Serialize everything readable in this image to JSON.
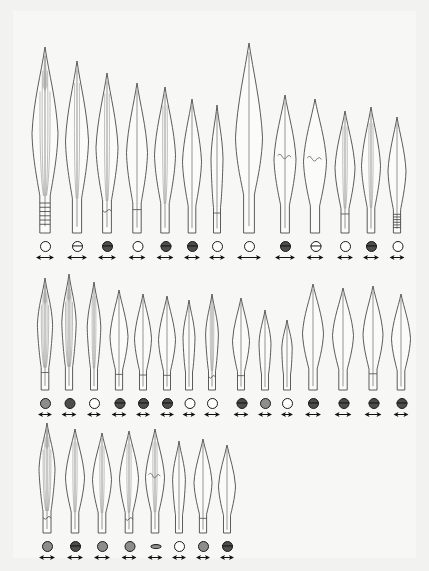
{
  "plate": {
    "title": "",
    "background_color": "#f2f2f0",
    "paper_color": "#f7f7f5",
    "ink_color": "#4a4a4a",
    "figure_type": "archaeological-typology-plate",
    "subject": "bronze spearheads",
    "total_items": 36,
    "row_counts": [
      13,
      15,
      8
    ]
  },
  "legend": {
    "section_symbol_note": "circle = blade cross-section",
    "scale_symbol_note": "double-headed arrow = scale bar"
  },
  "rows": [
    {
      "row_index": 0,
      "items": [
        {
          "num": "1",
          "x": 32,
          "h": 186,
          "w": 26,
          "blade": "leaf",
          "section": "open",
          "socket": "hatched",
          "arrow": 18,
          "ribs": 3,
          "shade": true,
          "break": false
        },
        {
          "num": "2",
          "x": 64,
          "h": 172,
          "w": 23,
          "blade": "leaf",
          "section": "line",
          "socket": "plain",
          "arrow": 20,
          "ribs": 2,
          "shade": false,
          "break": false
        },
        {
          "num": "3",
          "x": 94,
          "h": 160,
          "w": 22,
          "blade": "leaf",
          "section": "half",
          "socket": "notched",
          "arrow": 18,
          "ribs": 2,
          "shade": false,
          "break": false
        },
        {
          "num": "4",
          "x": 124,
          "h": 150,
          "w": 21,
          "blade": "leaf",
          "section": "open",
          "socket": "band",
          "arrow": 17,
          "ribs": 1,
          "shade": false,
          "break": false
        },
        {
          "num": "5",
          "x": 152,
          "h": 146,
          "w": 21,
          "blade": "leaf",
          "section": "half",
          "socket": "plain",
          "arrow": 17,
          "ribs": 2,
          "shade": false,
          "break": false
        },
        {
          "num": "6",
          "x": 179,
          "h": 134,
          "w": 19,
          "blade": "leaf",
          "section": "half",
          "socket": "plain",
          "arrow": 16,
          "ribs": 1,
          "shade": false,
          "break": false
        },
        {
          "num": "7",
          "x": 204,
          "h": 128,
          "w": 15,
          "blade": "slim",
          "section": "open",
          "socket": "band",
          "arrow": 16,
          "ribs": 1,
          "shade": false,
          "break": false
        },
        {
          "num": "8",
          "x": 236,
          "h": 190,
          "w": 27,
          "blade": "broad",
          "section": "open",
          "socket": "plain",
          "arrow": 24,
          "ribs": 1,
          "shade": false,
          "break": false
        },
        {
          "num": "9",
          "x": 272,
          "h": 138,
          "w": 22,
          "blade": "leaf",
          "section": "half",
          "socket": "plain",
          "arrow": 20,
          "ribs": 1,
          "shade": false,
          "break": true
        },
        {
          "num": "10",
          "x": 302,
          "h": 134,
          "w": 23,
          "blade": "leaf",
          "section": "line",
          "socket": "plain",
          "arrow": 17,
          "ribs": 0,
          "shade": false,
          "break": true
        },
        {
          "num": "11",
          "x": 332,
          "h": 122,
          "w": 20,
          "blade": "leaf",
          "section": "open",
          "socket": "band",
          "arrow": 16,
          "ribs": 2,
          "shade": false,
          "break": false
        },
        {
          "num": "12",
          "x": 358,
          "h": 126,
          "w": 19,
          "blade": "leaf",
          "section": "half",
          "socket": "plain",
          "arrow": 16,
          "ribs": 2,
          "shade": false,
          "break": false
        },
        {
          "num": "13",
          "x": 384,
          "h": 116,
          "w": 18,
          "blade": "leaf",
          "section": "open",
          "socket": "hatched",
          "arrow": 15,
          "ribs": 1,
          "shade": false,
          "break": false
        }
      ]
    },
    {
      "row_index": 1,
      "items": [
        {
          "num": "14",
          "x": 32,
          "h": 112,
          "w": 19,
          "blade": "slim",
          "section": "grey",
          "socket": "band",
          "arrow": 14,
          "ribs": 3,
          "shade": true,
          "break": false
        },
        {
          "num": "15",
          "x": 56,
          "h": 116,
          "w": 18,
          "blade": "slim",
          "section": "filled",
          "socket": "plain",
          "arrow": 15,
          "ribs": 3,
          "shade": true,
          "break": false
        },
        {
          "num": "16",
          "x": 81,
          "h": 108,
          "w": 17,
          "blade": "slim",
          "section": "open",
          "socket": "plain",
          "arrow": 14,
          "ribs": 2,
          "shade": false,
          "break": false
        },
        {
          "num": "17",
          "x": 106,
          "h": 100,
          "w": 18,
          "blade": "leaf",
          "section": "half",
          "socket": "band",
          "arrow": 15,
          "ribs": 1,
          "shade": false,
          "break": false
        },
        {
          "num": "18",
          "x": 130,
          "h": 96,
          "w": 17,
          "blade": "leaf",
          "section": "half",
          "socket": "band",
          "arrow": 14,
          "ribs": 1,
          "shade": false,
          "break": false
        },
        {
          "num": "19",
          "x": 154,
          "h": 94,
          "w": 17,
          "blade": "leaf",
          "section": "half",
          "socket": "band",
          "arrow": 14,
          "ribs": 1,
          "shade": false,
          "break": false
        },
        {
          "num": "20",
          "x": 176,
          "h": 90,
          "w": 15,
          "blade": "slim",
          "section": "open",
          "socket": "plain",
          "arrow": 13,
          "ribs": 1,
          "shade": false,
          "break": false
        },
        {
          "num": "21",
          "x": 199,
          "h": 96,
          "w": 16,
          "blade": "slim",
          "section": "open",
          "socket": "notched",
          "arrow": 16,
          "ribs": 2,
          "shade": false,
          "break": false
        },
        {
          "num": "22",
          "x": 228,
          "h": 92,
          "w": 17,
          "blade": "leaf",
          "section": "half",
          "socket": "band",
          "arrow": 15,
          "ribs": 1,
          "shade": false,
          "break": false
        },
        {
          "num": "23",
          "x": 252,
          "h": 80,
          "w": 15,
          "blade": "slim",
          "section": "grey",
          "socket": "plain",
          "arrow": 14,
          "ribs": 1,
          "shade": false,
          "break": false
        },
        {
          "num": "24",
          "x": 274,
          "h": 70,
          "w": 13,
          "blade": "slim",
          "section": "open",
          "socket": "plain",
          "arrow": 12,
          "ribs": 1,
          "shade": false,
          "break": false
        },
        {
          "num": "25",
          "x": 300,
          "h": 106,
          "w": 21,
          "blade": "leaf",
          "section": "half",
          "socket": "plain",
          "arrow": 16,
          "ribs": 1,
          "shade": false,
          "break": false
        },
        {
          "num": "26",
          "x": 330,
          "h": 102,
          "w": 21,
          "blade": "leaf",
          "section": "half",
          "socket": "plain",
          "arrow": 17,
          "ribs": 1,
          "shade": false,
          "break": false
        },
        {
          "num": "27",
          "x": 360,
          "h": 104,
          "w": 20,
          "blade": "leaf",
          "section": "half",
          "socket": "band",
          "arrow": 17,
          "ribs": 1,
          "shade": false,
          "break": false
        },
        {
          "num": "28",
          "x": 388,
          "h": 96,
          "w": 19,
          "blade": "leaf",
          "section": "half",
          "socket": "plain",
          "arrow": 15,
          "ribs": 1,
          "shade": false,
          "break": false
        }
      ]
    },
    {
      "row_index": 2,
      "items": [
        {
          "num": "29",
          "x": 34,
          "h": 110,
          "w": 20,
          "blade": "slim",
          "section": "grey",
          "socket": "notched",
          "arrow": 16,
          "ribs": 3,
          "shade": true,
          "break": false
        },
        {
          "num": "30",
          "x": 62,
          "h": 104,
          "w": 19,
          "blade": "leaf",
          "section": "half",
          "socket": "plain",
          "arrow": 16,
          "ribs": 2,
          "shade": false,
          "break": false
        },
        {
          "num": "31",
          "x": 89,
          "h": 100,
          "w": 19,
          "blade": "leaf",
          "section": "grey",
          "socket": "plain",
          "arrow": 16,
          "ribs": 2,
          "shade": false,
          "break": false
        },
        {
          "num": "32",
          "x": 116,
          "h": 102,
          "w": 19,
          "blade": "leaf",
          "section": "grey",
          "socket": "notched",
          "arrow": 15,
          "ribs": 2,
          "shade": false,
          "break": false
        },
        {
          "num": "33",
          "x": 142,
          "h": 104,
          "w": 19,
          "blade": "leaf",
          "section": "lens",
          "socket": "plain",
          "arrow": 15,
          "ribs": 2,
          "shade": false,
          "break": true
        },
        {
          "num": "34",
          "x": 166,
          "h": 92,
          "w": 16,
          "blade": "slim",
          "section": "open",
          "socket": "plain",
          "arrow": 14,
          "ribs": 1,
          "shade": false,
          "break": false
        },
        {
          "num": "35",
          "x": 190,
          "h": 94,
          "w": 18,
          "blade": "leaf",
          "section": "grey",
          "socket": "band",
          "arrow": 14,
          "ribs": 1,
          "shade": false,
          "break": false
        },
        {
          "num": "36",
          "x": 214,
          "h": 88,
          "w": 17,
          "blade": "leaf",
          "section": "half",
          "socket": "plain",
          "arrow": 14,
          "ribs": 1,
          "shade": false,
          "break": false
        }
      ]
    }
  ],
  "row_baselines": [
    224,
    381,
    524
  ]
}
